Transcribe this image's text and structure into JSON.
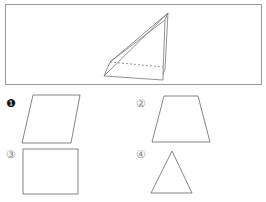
{
  "figure": {
    "stroke_color": "#777777",
    "frame_color": "#9a9a9a"
  },
  "options": [
    {
      "label": "❶",
      "shape": "parallelogram",
      "selected": true
    },
    {
      "label": "②",
      "shape": "trapezoid",
      "selected": false
    },
    {
      "label": "③",
      "shape": "square",
      "selected": false
    },
    {
      "label": "④",
      "shape": "triangle",
      "selected": false
    }
  ]
}
